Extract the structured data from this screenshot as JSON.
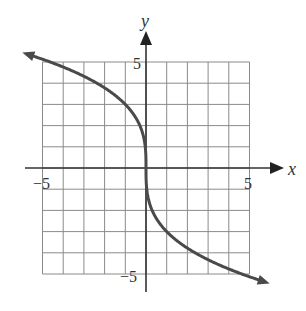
{
  "chart_data": {
    "type": "line",
    "title": "",
    "xlabel": "x",
    "ylabel": "y",
    "xlim": [
      -5,
      5
    ],
    "ylim": [
      -5,
      5
    ],
    "grid": true,
    "x_tick_labels": [
      "-5",
      "5"
    ],
    "y_tick_labels": [
      "5",
      "-5"
    ],
    "function": "y = -3 * cbrt(x)",
    "series": [
      {
        "name": "curve",
        "x": [
          -5.7,
          -5,
          -4,
          -3,
          -2,
          -1,
          -0.5,
          -0.1,
          0,
          0.1,
          0.5,
          1,
          2,
          3,
          4,
          5,
          5.7
        ],
        "y": [
          5.36,
          5.13,
          4.76,
          4.33,
          3.78,
          3.0,
          2.38,
          1.39,
          0,
          -1.39,
          -2.38,
          -3.0,
          -3.78,
          -4.33,
          -4.76,
          -5.13,
          -5.36
        ],
        "arrows": "both",
        "color": "#444444"
      }
    ]
  },
  "labels": {
    "x_axis": "x",
    "y_axis": "y",
    "x_min": "−5",
    "x_max": "5",
    "y_max": "5",
    "y_min": "−5"
  },
  "colors": {
    "grid": "#8a8a8a",
    "axis": "#333333",
    "curve": "#4a4a4a"
  }
}
